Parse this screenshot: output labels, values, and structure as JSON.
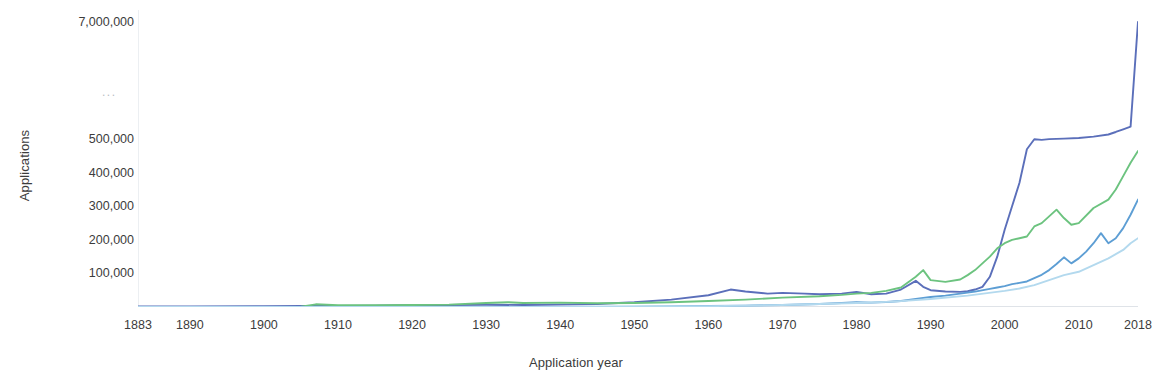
{
  "chart": {
    "type": "line",
    "title": "",
    "xlabel": "Application year",
    "ylabel": "Applications",
    "axis_break_marker": "...",
    "background": "#ffffff",
    "grid": false,
    "legend": "none",
    "plot_area": {
      "left": 138,
      "top": 10,
      "width": 1000,
      "height": 297
    }
  },
  "chart_data": {
    "type": "line",
    "title": "",
    "xlabel": "Application year",
    "ylabel": "Applications",
    "grid": false,
    "legend_position": "none",
    "axis_note": "Broken y-axis: linear 0-500,000 below the break, then jumps to 7,000,000 at the top. Ellipsis marks the break.",
    "xlim": [
      1883,
      2018
    ],
    "ylim": [
      0,
      500000
    ],
    "y_top_value": 7000000,
    "xticks": [
      1883,
      1890,
      1900,
      1910,
      1920,
      1930,
      1940,
      1950,
      1960,
      1970,
      1980,
      1990,
      2000,
      2010,
      2018
    ],
    "xtick_labels": [
      "1883",
      "1890",
      "1900",
      "1910",
      "1920",
      "1930",
      "1940",
      "1950",
      "1960",
      "1970",
      "1980",
      "1990",
      "2000",
      "2010",
      "2018"
    ],
    "yticks": [
      100000,
      200000,
      300000,
      400000,
      500000,
      7000000
    ],
    "ytick_labels": [
      "100,000",
      "200,000",
      "300,000",
      "400,000",
      "500,000",
      "7,000,000"
    ],
    "series": [
      {
        "name": "series-navy",
        "color": "#5b6fba",
        "x": [
          1883,
          1890,
          1900,
          1905,
          1910,
          1915,
          1920,
          1925,
          1930,
          1935,
          1940,
          1945,
          1950,
          1955,
          1960,
          1963,
          1965,
          1968,
          1970,
          1973,
          1975,
          1978,
          1980,
          1982,
          1984,
          1986,
          1988,
          1989,
          1990,
          1992,
          1994,
          1995,
          1996,
          1997,
          1998,
          1999,
          2000,
          2001,
          2002,
          2003,
          2004,
          2005,
          2006,
          2008,
          2010,
          2012,
          2014,
          2015,
          2016,
          2017,
          2018
        ],
        "values": [
          1500,
          2000,
          2500,
          3000,
          3500,
          4000,
          5000,
          6000,
          6500,
          6000,
          7000,
          9000,
          14000,
          22000,
          35000,
          52000,
          46000,
          40000,
          42000,
          40000,
          38000,
          40000,
          45000,
          38000,
          40000,
          52000,
          78000,
          60000,
          50000,
          46000,
          45000,
          47000,
          52000,
          60000,
          90000,
          150000,
          230000,
          300000,
          370000,
          470000,
          500000,
          498000,
          505000,
          530000,
          570000,
          640000,
          760000,
          900000,
          1050000,
          1200000,
          7000000
        ]
      },
      {
        "name": "series-green",
        "color": "#6cc37f",
        "x": [
          1883,
          1890,
          1900,
          1905,
          1907,
          1910,
          1915,
          1920,
          1925,
          1930,
          1933,
          1935,
          1940,
          1945,
          1950,
          1955,
          1960,
          1965,
          1970,
          1975,
          1978,
          1980,
          1982,
          1984,
          1986,
          1988,
          1989,
          1990,
          1992,
          1994,
          1995,
          1996,
          1997,
          1998,
          1999,
          2000,
          2001,
          2002,
          2003,
          2004,
          2005,
          2006,
          2007,
          2008,
          2009,
          2010,
          2012,
          2014,
          2015,
          2016,
          2017,
          2018
        ],
        "values": [
          0,
          0,
          0,
          1000,
          8000,
          5000,
          5000,
          6000,
          7000,
          12000,
          14000,
          12000,
          13000,
          11000,
          12000,
          14000,
          18000,
          22000,
          28000,
          32000,
          36000,
          40000,
          42000,
          48000,
          58000,
          90000,
          110000,
          80000,
          75000,
          82000,
          95000,
          110000,
          130000,
          150000,
          175000,
          190000,
          200000,
          205000,
          210000,
          240000,
          250000,
          270000,
          290000,
          265000,
          245000,
          250000,
          295000,
          320000,
          350000,
          390000,
          430000,
          465000
        ]
      },
      {
        "name": "series-medium-blue",
        "color": "#5d9ed4",
        "x": [
          1883,
          1890,
          1900,
          1910,
          1920,
          1930,
          1940,
          1950,
          1955,
          1960,
          1965,
          1970,
          1975,
          1978,
          1980,
          1982,
          1984,
          1986,
          1988,
          1990,
          1992,
          1994,
          1996,
          1998,
          1999,
          2000,
          2001,
          2002,
          2003,
          2004,
          2005,
          2006,
          2007,
          2008,
          2009,
          2010,
          2011,
          2012,
          2013,
          2014,
          2015,
          2016,
          2017,
          2018
        ],
        "values": [
          0,
          0,
          0,
          0,
          0,
          0,
          0,
          1000,
          2000,
          3000,
          4000,
          6000,
          9000,
          12000,
          14000,
          13000,
          15000,
          18000,
          24000,
          30000,
          34000,
          40000,
          46000,
          54000,
          58000,
          62000,
          68000,
          72000,
          76000,
          86000,
          96000,
          110000,
          128000,
          148000,
          130000,
          145000,
          165000,
          190000,
          220000,
          190000,
          205000,
          235000,
          275000,
          320000
        ]
      },
      {
        "name": "series-light-blue",
        "color": "#b3d9ee",
        "x": [
          1883,
          1900,
          1910,
          1920,
          1930,
          1940,
          1950,
          1955,
          1960,
          1965,
          1970,
          1975,
          1980,
          1985,
          1990,
          1995,
          2000,
          2002,
          2004,
          2006,
          2008,
          2010,
          2012,
          2014,
          2016,
          2017,
          2018
        ],
        "values": [
          0,
          0,
          0,
          0,
          0,
          0,
          800,
          1500,
          2500,
          4000,
          6000,
          9000,
          12000,
          16000,
          24000,
          34000,
          48000,
          55000,
          65000,
          80000,
          95000,
          105000,
          125000,
          145000,
          170000,
          190000,
          205000
        ]
      }
    ]
  }
}
